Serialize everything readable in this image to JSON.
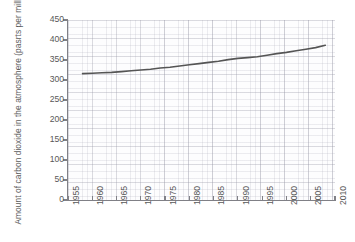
{
  "chart_data": {
    "type": "line",
    "title": "",
    "xlabel": "",
    "ylabel": "Amount of carbon dioxide in the atmosphere (pasrts per million)",
    "xlim": [
      1955,
      2010
    ],
    "ylim": [
      0,
      450
    ],
    "grid": true,
    "legend": false,
    "x_ticks": [
      "1955",
      "1960",
      "1965",
      "1970",
      "1975",
      "1980",
      "1985",
      "1990",
      "1995",
      "2000",
      "2005",
      "2010"
    ],
    "y_ticks": [
      "0",
      "50",
      "100",
      "150",
      "200",
      "250",
      "300",
      "350",
      "400",
      "450"
    ],
    "line_color": "#555555",
    "series": [
      {
        "name": "Atmospheric CO2",
        "x": [
          1958,
          1960,
          1962,
          1964,
          1966,
          1968,
          1970,
          1972,
          1974,
          1976,
          1978,
          1980,
          1982,
          1984,
          1986,
          1988,
          1990,
          1992,
          1994,
          1996,
          1998,
          2000,
          2002,
          2004,
          2006,
          2008
        ],
        "values": [
          316,
          317,
          318,
          319,
          321,
          323,
          325,
          327,
          330,
          332,
          335,
          338,
          341,
          344,
          347,
          351,
          354,
          356,
          358,
          362,
          366,
          369,
          373,
          377,
          381,
          387
        ]
      }
    ]
  },
  "axes": {
    "y_title": "Amount of carbon dioxide in the atmosphere (pasrts per million)"
  }
}
